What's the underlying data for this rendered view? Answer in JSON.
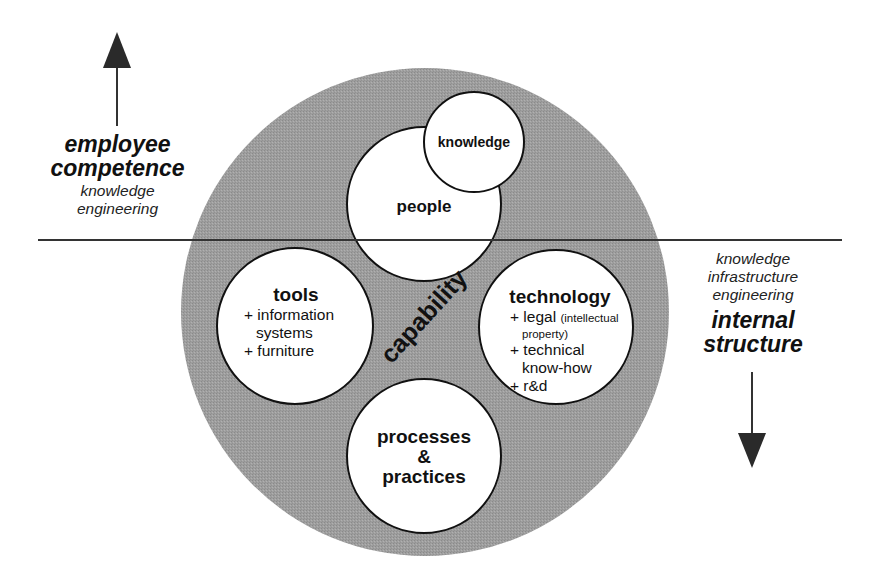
{
  "diagram": {
    "left_dimension": {
      "title_line1": "employee",
      "title_line2": "competence",
      "subtitle_line1": "knowledge",
      "subtitle_line2": "engineering",
      "arrow_direction": "up"
    },
    "right_dimension": {
      "subtitle_line1": "knowledge",
      "subtitle_line2": "infrastructure",
      "subtitle_line3": "engineering",
      "title_line1": "internal",
      "title_line2": "structure",
      "arrow_direction": "down"
    },
    "center": {
      "label": "capability"
    },
    "circles": {
      "knowledge": {
        "title": "knowledge"
      },
      "people": {
        "title": "people"
      },
      "tools": {
        "title": "tools",
        "items": [
          "+ information",
          "systems",
          "+ furniture"
        ]
      },
      "technology": {
        "title": "technology",
        "items": {
          "legal": "+ legal",
          "legal_note": "(intellectual",
          "legal_note2": "property)",
          "technical": "+ technical",
          "technical2": "know-how",
          "rnd": "+ r&d"
        }
      },
      "processes": {
        "title_line1": "processes",
        "title_line2": "&",
        "title_line3": "practices"
      }
    },
    "colors": {
      "capability_fill": "#9c9c9c",
      "circle_fill": "#ffffff",
      "stroke": "#111111",
      "divider": "#333333"
    }
  }
}
